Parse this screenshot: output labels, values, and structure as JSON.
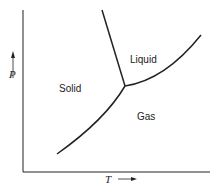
{
  "diagram": {
    "type": "phase-diagram",
    "axes": {
      "x_label": "T",
      "x_arrow": "→",
      "y_label": "P",
      "y_arrow": "↑"
    },
    "regions": {
      "solid": "Solid",
      "liquid": "Liquid",
      "gas": "Gas"
    },
    "curves": [
      {
        "name": "melting-curve",
        "from": "triple-point",
        "to": "top"
      },
      {
        "name": "vaporization-curve",
        "from": "triple-point",
        "to": "upper-right"
      },
      {
        "name": "sublimation-curve",
        "from": "lower-left",
        "to": "triple-point"
      }
    ],
    "line_color": "#222222"
  }
}
